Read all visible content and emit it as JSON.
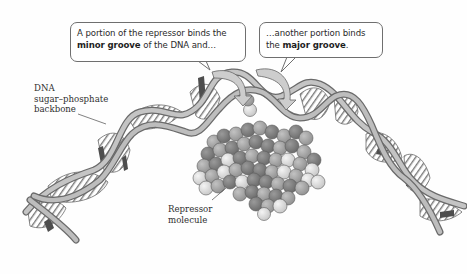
{
  "figure": {
    "callouts": [
      {
        "id": "minor-groove-callout",
        "line1": "A portion of the repressor binds the",
        "line2_bold": "minor groove",
        "line2_rest": " of the DNA and…"
      },
      {
        "id": "major-groove-callout",
        "line1": "…another portion binds",
        "line2_pre": "the ",
        "line2_bold": "major groove",
        "line2_rest": "."
      }
    ],
    "labels": {
      "backbone": [
        "DNA",
        "sugar–phosphate",
        "backbone"
      ],
      "repressor": [
        "Repressor",
        "molecule"
      ]
    },
    "colors": {
      "backbone_fill": "#b9b9b9",
      "backbone_edge": "#6a6a6a",
      "base_stripe": "#7a7a7a",
      "groove_shadow": "#4a4a4a",
      "arrow_fill": "#c8c8c8",
      "atom_dark": "#7c7c7c",
      "atom_mid": "#a3a3a3",
      "atom_light": "#dcdcdc"
    }
  }
}
